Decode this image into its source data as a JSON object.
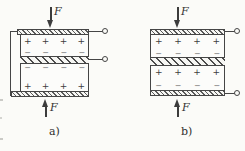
{
  "figure": {
    "ink_color": "#454545",
    "background_color": "#fbfbf8",
    "diagrams": [
      {
        "id": "a",
        "caption": "a)",
        "connection": "parallel-with-bracket",
        "force_top_label": "F",
        "force_bottom_label": "F",
        "terminal_count": 2,
        "plates": [
          {
            "top_charges": [
              "+",
              "+",
              "+",
              "+"
            ],
            "bottom_charges": [
              "−",
              "−",
              "−",
              "−"
            ]
          },
          {
            "top_charges": [
              "−",
              "−",
              "−",
              "−"
            ],
            "bottom_charges": [
              "+",
              "+",
              "+",
              "+"
            ]
          }
        ]
      },
      {
        "id": "b",
        "caption": "b)",
        "connection": "series",
        "force_top_label": "F",
        "force_bottom_label": "F",
        "terminal_count": 2,
        "plates": [
          {
            "top_charges": [
              "+",
              "+",
              "+",
              "+"
            ],
            "bottom_charges": [
              "−",
              "−",
              "−",
              "−"
            ]
          },
          {
            "top_charges": [
              "+",
              "+",
              "+",
              "+"
            ],
            "bottom_charges": [
              "−",
              "−",
              "−",
              "−"
            ]
          }
        ]
      }
    ]
  }
}
